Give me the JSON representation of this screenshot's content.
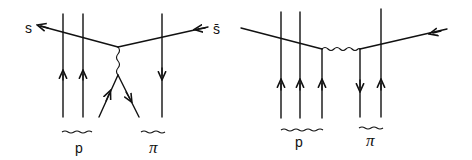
{
  "diagrams": [
    {
      "id": "left",
      "labels": {
        "quark_out": "s",
        "antiquark_in": "s̄",
        "group_1": "p",
        "group_2": "π"
      }
    },
    {
      "id": "right",
      "labels": {
        "group_1": "p",
        "group_2": "π"
      }
    }
  ]
}
